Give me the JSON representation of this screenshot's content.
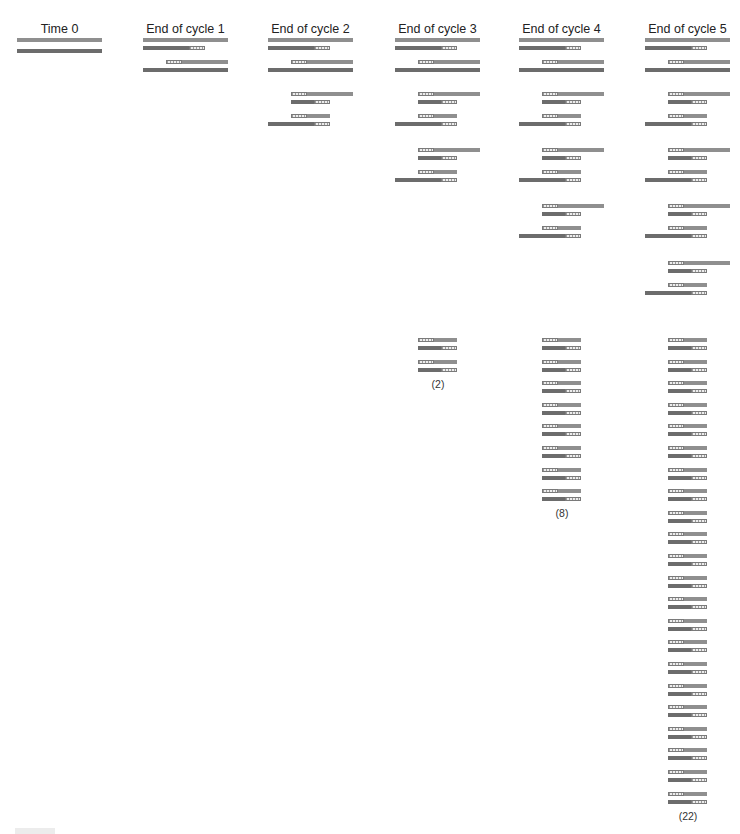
{
  "diagram": {
    "columns": [
      {
        "label": "Time 0",
        "count_label": ""
      },
      {
        "label": "End of cycle 1",
        "count_label": ""
      },
      {
        "label": "End of cycle 2",
        "count_label": ""
      },
      {
        "label": "End of cycle 3",
        "count_label": "(2)"
      },
      {
        "label": "End of cycle 4",
        "count_label": "(8)"
      },
      {
        "label": "End of cycle 5",
        "count_label": "(22)"
      }
    ],
    "legend": {
      "long_strand": "template DNA strand (gray bar)",
      "primer": "primer segment (hatched box)",
      "short_product": "target-length double-stranded product"
    },
    "colors": {
      "template_strand": "#8f8f8f",
      "new_strand": "#6c6c6c",
      "primer_fill": "#ececec",
      "text": "#222222"
    }
  }
}
